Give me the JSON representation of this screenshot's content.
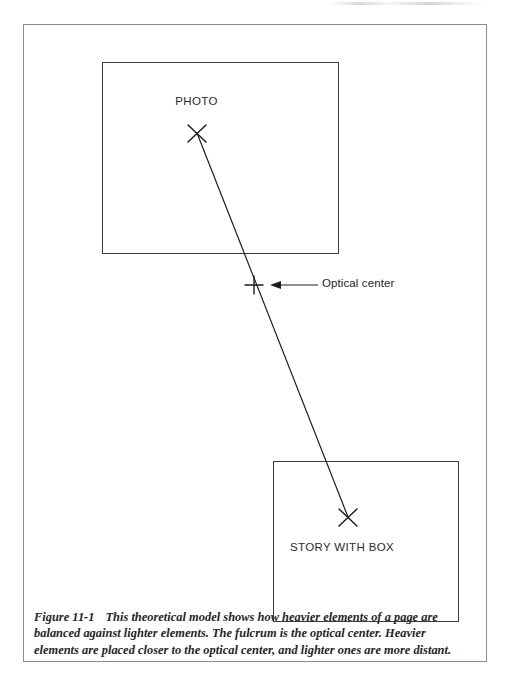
{
  "figure": {
    "caption_label": "Figure 11-1",
    "caption_text": "This theoretical model shows how heavier elements of a page are balanced against lighter elements. The fulcrum is the optical center. Heavier elements are placed closer to the optical center, and lighter ones are more distant."
  },
  "boxes": {
    "photo": {
      "label": "PHOTO",
      "x": 78,
      "y": 37,
      "width": 237,
      "height": 192,
      "border_color": "#3b3b3f"
    },
    "story": {
      "label": "STORY WITH BOX",
      "x": 249,
      "y": 436,
      "width": 186,
      "height": 161,
      "border_color": "#3b3b3f"
    }
  },
  "markers": {
    "photo_x": {
      "cx": 197,
      "cy": 133,
      "arm": 10,
      "symbol": "x-mark"
    },
    "story_x": {
      "cx": 348,
      "cy": 517,
      "arm": 10,
      "symbol": "x-mark"
    },
    "fulcrum": {
      "cx": 254,
      "cy": 285,
      "arm": 8,
      "symbol": "plus-mark"
    }
  },
  "balance_line": {
    "x1": 197,
    "y1": 133,
    "x2": 348,
    "y2": 517,
    "stroke": "#1e1e22",
    "stroke_width": 1.2
  },
  "annotation": {
    "label": "Optical center",
    "arrow": {
      "tail_x": 318,
      "tail_y": 285,
      "head_x": 270,
      "head_y": 285
    },
    "label_x": 322,
    "label_y": 277
  },
  "frame": {
    "x": 23,
    "y": 24,
    "width": 464,
    "height": 638,
    "border_color": "#8d8d91"
  },
  "colors": {
    "page_background": "#ffffff",
    "ink": "#1e1e22",
    "frame_line": "#8d8d91",
    "box_line": "#3b3b3f"
  }
}
